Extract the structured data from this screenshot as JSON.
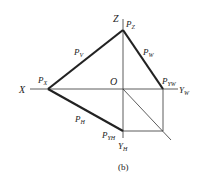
{
  "figure": {
    "caption": "(b)",
    "axes": {
      "x_label": "X",
      "z_label": "Z",
      "yw_label": "Y",
      "yw_sub": "W",
      "yh_label": "Y",
      "yh_sub": "H",
      "origin_label": "O"
    },
    "points": {
      "pz": {
        "main": "P",
        "sub": "Z"
      },
      "px": {
        "main": "P",
        "sub": "X"
      },
      "pyw": {
        "main": "P",
        "sub": "YW"
      },
      "pyh": {
        "main": "P",
        "sub": "YH"
      }
    },
    "traces": {
      "pv": {
        "main": "P",
        "sub": "V"
      },
      "pw": {
        "main": "P",
        "sub": "W"
      },
      "ph": {
        "main": "P",
        "sub": "H"
      }
    },
    "colors": {
      "line": "#222222",
      "background": "#ffffff"
    }
  }
}
